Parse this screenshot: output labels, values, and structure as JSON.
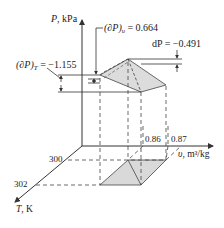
{
  "axes": {
    "p_axis": {
      "label_var": "P",
      "label_unit": ", kPa"
    },
    "v_axis": {
      "label_var": "υ",
      "label_unit": ", m³/kg"
    },
    "t_axis": {
      "label_var": "T",
      "label_unit": ", K"
    }
  },
  "ticks": {
    "v": [
      "0.86",
      "0.87"
    ],
    "t": [
      "300",
      "302"
    ]
  },
  "annotations": {
    "dp_v": {
      "lhs": "(∂P)",
      "sub": "υ",
      "rhs": " = 0.664"
    },
    "dp_t": {
      "lhs": "(∂P)",
      "sub": "T",
      "rhs": " = −1.155"
    },
    "dp_total": {
      "text": "dP = −0.491"
    }
  },
  "colors": {
    "line": "#333333",
    "shade": "#d9d9d9"
  }
}
